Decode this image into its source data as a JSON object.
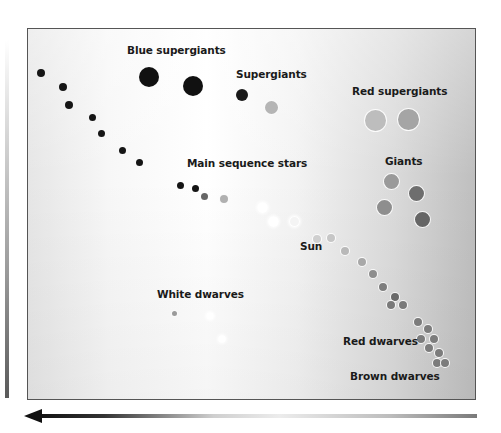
{
  "diagram": {
    "axes": {
      "vertical_arrow": "luminosity-gradient-bar",
      "horizontal_arrow": "temperature-gradient-arrow-pointing-left"
    },
    "labels": [
      {
        "id": "blue-supergiants",
        "text": "Blue supergiants",
        "x": 127,
        "y": 44
      },
      {
        "id": "supergiants",
        "text": "Supergiants",
        "x": 236,
        "y": 68
      },
      {
        "id": "red-supergiants",
        "text": "Red supergiants",
        "x": 352,
        "y": 85
      },
      {
        "id": "main-sequence",
        "text": "Main sequence stars",
        "x": 187,
        "y": 157
      },
      {
        "id": "giants",
        "text": "Giants",
        "x": 385,
        "y": 155
      },
      {
        "id": "sun",
        "text": "Sun",
        "x": 300,
        "y": 240
      },
      {
        "id": "white-dwarves",
        "text": "White dwarves",
        "x": 157,
        "y": 288
      },
      {
        "id": "red-dwarves",
        "text": "Red dwarves",
        "x": 343,
        "y": 335
      },
      {
        "id": "brown-dwarves",
        "text": "Brown dwarves",
        "x": 350,
        "y": 370
      }
    ],
    "stars": {
      "blue_supergiants": [
        {
          "x": 149,
          "y": 77,
          "r": 10,
          "color": "#111111"
        },
        {
          "x": 193,
          "y": 86,
          "r": 10,
          "color": "#111111"
        }
      ],
      "supergiants": [
        {
          "x": 242,
          "y": 95,
          "r": 6,
          "color": "#1a1a1a"
        },
        {
          "x": 271,
          "y": 107,
          "r": 6,
          "color": "#b5b5b5"
        }
      ],
      "red_supergiants": [
        {
          "x": 375,
          "y": 120,
          "r": 10,
          "color": "#bdbdbd"
        },
        {
          "x": 408,
          "y": 119,
          "r": 10,
          "color": "#a5a5a5"
        }
      ],
      "giants": [
        {
          "x": 391,
          "y": 181,
          "r": 7,
          "color": "#9a9a9a"
        },
        {
          "x": 416,
          "y": 193,
          "r": 7,
          "color": "#6e6e6e"
        },
        {
          "x": 384,
          "y": 207,
          "r": 7,
          "color": "#8e8e8e"
        },
        {
          "x": 422,
          "y": 219,
          "r": 7,
          "color": "#666666"
        }
      ],
      "main_sequence": [
        {
          "x": 41,
          "y": 73,
          "r": 4,
          "color": "#151515"
        },
        {
          "x": 63,
          "y": 87,
          "r": 4,
          "color": "#151515"
        },
        {
          "x": 69,
          "y": 105,
          "r": 4,
          "color": "#151515"
        },
        {
          "x": 92,
          "y": 117,
          "r": 3.5,
          "color": "#151515"
        },
        {
          "x": 101,
          "y": 133,
          "r": 3.5,
          "color": "#151515"
        },
        {
          "x": 122,
          "y": 150,
          "r": 3.5,
          "color": "#151515"
        },
        {
          "x": 139,
          "y": 162,
          "r": 3.5,
          "color": "#151515"
        },
        {
          "x": 180,
          "y": 185,
          "r": 3.5,
          "color": "#151515"
        },
        {
          "x": 195,
          "y": 188,
          "r": 3.5,
          "color": "#151515"
        },
        {
          "x": 204,
          "y": 196,
          "r": 3.5,
          "color": "#666666"
        },
        {
          "x": 224,
          "y": 199,
          "r": 3.5,
          "color": "#b0b0b0"
        },
        {
          "x": 262,
          "y": 207,
          "r": 4,
          "color": "#ffffff"
        },
        {
          "x": 273,
          "y": 221,
          "r": 4,
          "color": "#ffffff"
        },
        {
          "x": 294,
          "y": 221,
          "r": 4,
          "color": "#f4f4f4"
        },
        {
          "x": 317,
          "y": 239,
          "r": 3.5,
          "color": "#cfcfcf"
        },
        {
          "x": 331,
          "y": 238,
          "r": 3.5,
          "color": "#c6c6c6"
        },
        {
          "x": 345,
          "y": 251,
          "r": 3.5,
          "color": "#b9b9b9"
        },
        {
          "x": 362,
          "y": 262,
          "r": 3.5,
          "color": "#a8a8a8"
        },
        {
          "x": 373,
          "y": 274,
          "r": 3.5,
          "color": "#8e8e8e"
        },
        {
          "x": 383,
          "y": 287,
          "r": 3.5,
          "color": "#7e7e7e"
        },
        {
          "x": 395,
          "y": 297,
          "r": 3.5,
          "color": "#6a6a6a"
        },
        {
          "x": 391,
          "y": 305,
          "r": 3.5,
          "color": "#7a7a7a"
        },
        {
          "x": 403,
          "y": 305,
          "r": 3.5,
          "color": "#7a7a7a"
        },
        {
          "x": 418,
          "y": 322,
          "r": 3.5,
          "color": "#7c7c7c"
        },
        {
          "x": 428,
          "y": 329,
          "r": 3.5,
          "color": "#7c7c7c"
        },
        {
          "x": 421,
          "y": 339,
          "r": 3.5,
          "color": "#7c7c7c"
        },
        {
          "x": 434,
          "y": 339,
          "r": 3.5,
          "color": "#7c7c7c"
        },
        {
          "x": 429,
          "y": 348,
          "r": 3.5,
          "color": "#7c7c7c"
        },
        {
          "x": 439,
          "y": 353,
          "r": 3.5,
          "color": "#7c7c7c"
        },
        {
          "x": 437,
          "y": 363,
          "r": 3.5,
          "color": "#7c7c7c"
        },
        {
          "x": 445,
          "y": 363,
          "r": 3.5,
          "color": "#7c7c7c"
        }
      ],
      "white_dwarves": [
        {
          "x": 174,
          "y": 313,
          "r": 2,
          "color": "#9a9a9a"
        },
        {
          "x": 210,
          "y": 316,
          "r": 2.5,
          "color": "#ffffff"
        },
        {
          "x": 222,
          "y": 339,
          "r": 2.5,
          "color": "#ffffff"
        }
      ]
    }
  }
}
